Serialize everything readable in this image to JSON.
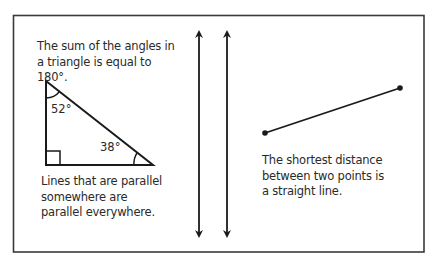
{
  "notes": {
    "angle_sum": "The sum of the angles in a triangle is equal to 180°.",
    "parallel": "Lines that are parallel somewhere are parallel everywhere.",
    "shortest": "The shortest distance between two points is a straight line."
  },
  "triangle": {
    "top_angle": "52°",
    "right_angle": "38°",
    "has_right_angle_marker": true
  },
  "colors": {
    "ink": "#1a1a1a",
    "frame": "#3a3a3a",
    "background": "#ffffff"
  }
}
